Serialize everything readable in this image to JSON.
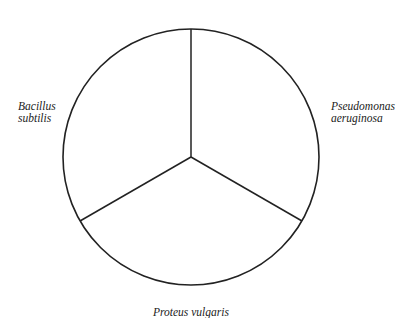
{
  "diagram": {
    "type": "pie-divided-circle",
    "segments": [
      {
        "name": "Pseudomonas aeruginosa",
        "line1": "Pseudomonas",
        "line2": "aeruginosa",
        "position": "right"
      },
      {
        "name": "Proteus vulgaris",
        "line1": "Proteus vulgaris",
        "position": "bottom"
      },
      {
        "name": "Bacillus subtilis",
        "line1": "Bacillus",
        "line2": "subtilis",
        "position": "left"
      }
    ],
    "colors": {
      "stroke": "#222222",
      "background": "#ffffff"
    }
  }
}
